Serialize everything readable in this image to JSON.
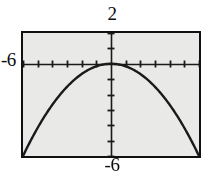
{
  "figure": {
    "kind": "graphing-calculator-screen",
    "background_color": "#ffffff",
    "screen_fill_color": "#e9e9e7",
    "frame_color": "#111111",
    "ink_color": "#1a1a1a"
  },
  "labels": {
    "ymax": "2",
    "ymin": "-6",
    "xmin": "-6"
  },
  "chart_data": {
    "type": "line",
    "title": "",
    "xlabel": "",
    "ylabel": "",
    "grid": false,
    "legend": false,
    "axes_style": "tick-marked-crosshair",
    "xlim": [
      -6,
      6
    ],
    "ylim": [
      -6,
      2
    ],
    "x_tick_step": 1,
    "y_tick_step": 1,
    "window_labels": {
      "xmin": "-6",
      "xmax": "",
      "ymin": "-6",
      "ymax": "2"
    },
    "series": [
      {
        "name": "downward parabola",
        "equation": "y = -0.167 x^2",
        "vertex": [
          0,
          0
        ],
        "opens": "down",
        "x": [
          -6,
          -5.5,
          -5,
          -4.5,
          -4,
          -3.5,
          -3,
          -2.5,
          -2,
          -1.5,
          -1,
          -0.5,
          0,
          0.5,
          1,
          1.5,
          2,
          2.5,
          3,
          3.5,
          4,
          4.5,
          5,
          5.5,
          6
        ],
        "values": [
          -6,
          -5.04,
          -4.17,
          -3.38,
          -2.67,
          -2.04,
          -1.5,
          -1.04,
          -0.67,
          -0.38,
          -0.17,
          -0.04,
          0,
          -0.04,
          -0.17,
          -0.38,
          -0.67,
          -1.04,
          -1.5,
          -2.04,
          -2.67,
          -3.38,
          -4.17,
          -5.04,
          -6
        ]
      }
    ]
  }
}
